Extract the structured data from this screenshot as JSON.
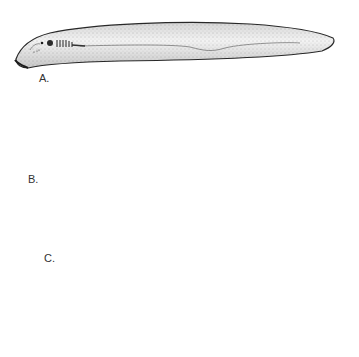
{
  "figure": {
    "type": "scientific-illustration",
    "panels": [
      {
        "id": "A",
        "label": "A.",
        "description": "elongate slender animal with gill slits behind head (lancelet-like)"
      },
      {
        "id": "B",
        "label": "B.",
        "description": "eel-like animal with eye and row of gill pores, two dorsal fins (lamprey)"
      },
      {
        "id": "C",
        "label": "C.",
        "description": "long curved eel-like animal with barbels and row of slime pores (hagfish)"
      }
    ]
  },
  "colors": {
    "background": "#ffffff",
    "outline": "#2a2a2a",
    "stipple": "#9a9a9a",
    "body_fill": "#f1f1f1",
    "fin_dark": "#5a5a5a"
  }
}
